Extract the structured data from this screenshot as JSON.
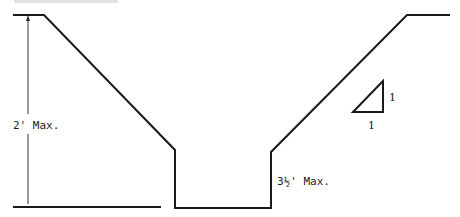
{
  "diagram": {
    "type": "trench cross-section",
    "labels": {
      "left_height": "2' Max.",
      "trench_depth": "3½' Max."
    },
    "slope_indicator": {
      "rise_label": "1",
      "run_label": "1",
      "ratio": "1:1"
    },
    "colors": {
      "line": "#1a1a1a",
      "background": "#ffffff"
    }
  }
}
